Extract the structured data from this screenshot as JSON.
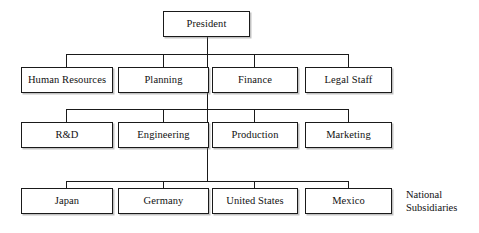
{
  "diagram": {
    "type": "organizational-chart",
    "stroke_color": "#1a1a1a",
    "background_color": "#ffffff",
    "text_color": "#111111",
    "root": {
      "label": "President"
    },
    "rows": [
      {
        "row_id": "functional-staff",
        "nodes": [
          {
            "label": "Human Resources"
          },
          {
            "label": "Planning"
          },
          {
            "label": "Finance"
          },
          {
            "label": "Legal Staff"
          }
        ]
      },
      {
        "row_id": "functional-line",
        "nodes": [
          {
            "label": "R&D"
          },
          {
            "label": "Engineering"
          },
          {
            "label": "Production"
          },
          {
            "label": "Marketing"
          }
        ]
      },
      {
        "row_id": "national-subsidiaries",
        "nodes": [
          {
            "label": "Japan"
          },
          {
            "label": "Germany"
          },
          {
            "label": "United States"
          },
          {
            "label": "Mexico"
          }
        ]
      }
    ],
    "annotations": [
      {
        "annotation_id": "national-subsidiaries-label",
        "line1": "National",
        "line2": "Subsidiaries"
      }
    ]
  }
}
